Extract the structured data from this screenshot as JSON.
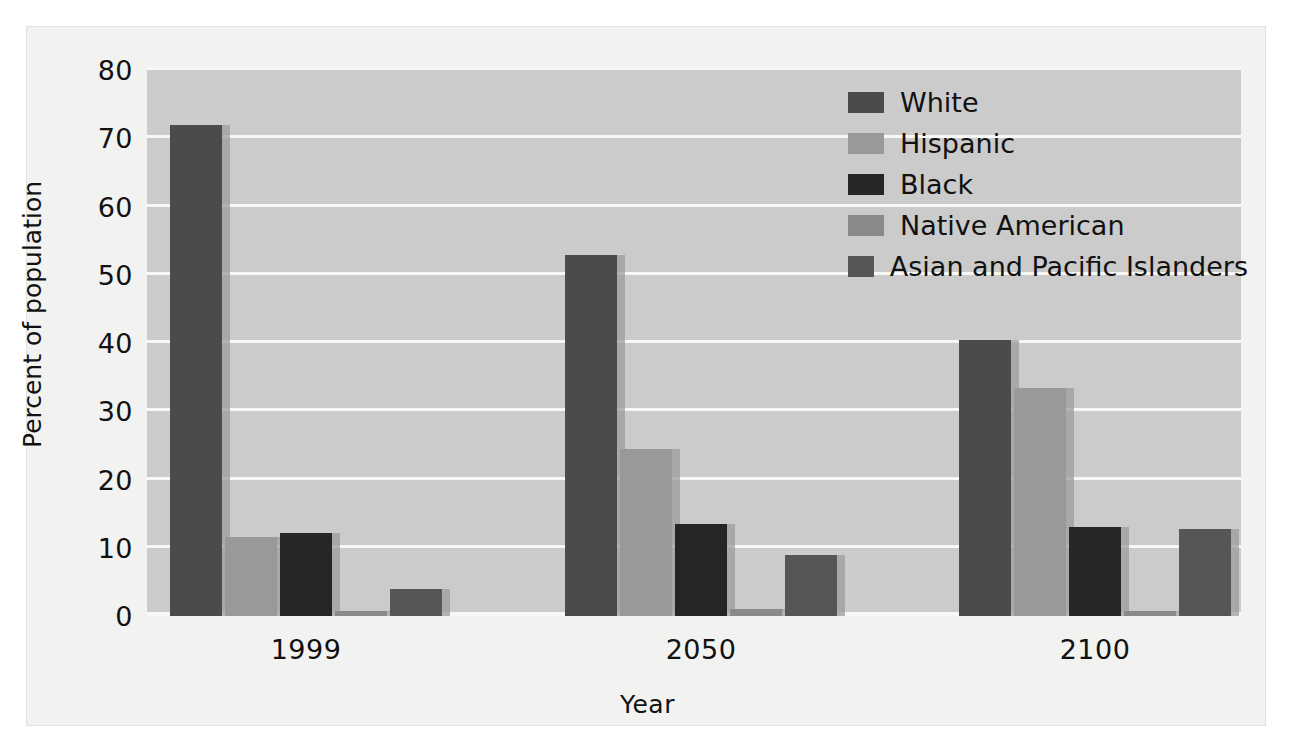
{
  "chart_data": {
    "type": "bar",
    "title": "",
    "xlabel": "Year",
    "ylabel": "Percent of population",
    "categories": [
      "1999",
      "2050",
      "2100"
    ],
    "ylim": [
      0,
      80
    ],
    "yticks": [
      0,
      10,
      20,
      30,
      40,
      50,
      60,
      70,
      80
    ],
    "ytick_labels": [
      "0",
      "10",
      "20",
      "30",
      "40",
      "50",
      "60",
      "70",
      "80"
    ],
    "grid": true,
    "legend_position": "top-right",
    "series": [
      {
        "name": "White",
        "color": "#4b4b4b",
        "values": [
          72.0,
          52.9,
          40.5
        ]
      },
      {
        "name": "Hispanic",
        "color": "#999999",
        "values": [
          11.6,
          24.5,
          33.4
        ]
      },
      {
        "name": "Black",
        "color": "#262626",
        "values": [
          12.2,
          13.5,
          13.1
        ]
      },
      {
        "name": "Native American",
        "color": "#8a8a8a",
        "values": [
          0.8,
          1.0,
          0.8
        ]
      },
      {
        "name": "Asian and Pacific Islanders",
        "color": "#565656",
        "values": [
          3.9,
          8.9,
          12.7
        ]
      }
    ]
  },
  "legend": {
    "entries": [
      {
        "label": "White"
      },
      {
        "label": "Hispanic"
      },
      {
        "label": "Black"
      },
      {
        "label": "Native American"
      },
      {
        "label": "Asian and Pacific Islanders"
      }
    ]
  },
  "axes": {
    "y_title": "Percent of population",
    "x_title": "Year"
  },
  "colors": {
    "plot_background": "#cbcbcb",
    "figure_background": "#f2f2f1",
    "gridline": "#f7f7f6",
    "text": "#111111",
    "shadow": "#9c9c9c"
  }
}
